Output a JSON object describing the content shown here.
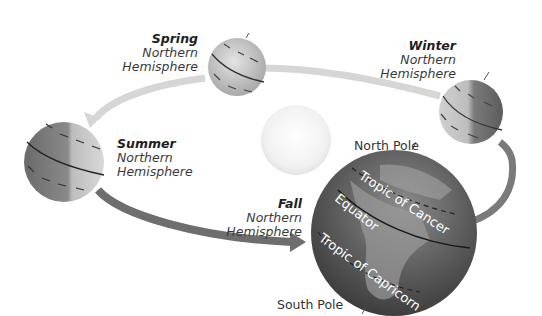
{
  "diagram": {
    "sun": {
      "label": ""
    },
    "seasons": [
      {
        "id": "spring",
        "season": "Spring",
        "line1": "Northern",
        "line2": "Hemisphere"
      },
      {
        "id": "winter",
        "season": "Winter",
        "line1": "Northern",
        "line2": "Hemisphere"
      },
      {
        "id": "summer",
        "season": "Summer",
        "line1": "Northern",
        "line2": "Hemisphere"
      },
      {
        "id": "fall",
        "season": "Fall",
        "line1": "Northern",
        "line2": "Hemisphere"
      }
    ],
    "earth_labels": {
      "north_pole": "North Pole",
      "south_pole": "South Pole",
      "tropic_cancer": "Tropic of Cancer",
      "equator": "Equator",
      "tropic_capricorn": "Tropic of Capricorn"
    },
    "colors": {
      "orbit_light": "#d4d4d4",
      "orbit_dark": "#6e6e6e",
      "globe_dark": "#5a5a5a",
      "globe_light": "#c8c8c8",
      "sun": "#f2f2f2"
    }
  }
}
